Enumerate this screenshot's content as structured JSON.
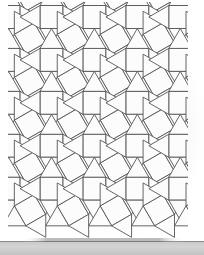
{
  "figure": {
    "shape_names": {
      "axis_square": "axis-aligned-square",
      "rotated_square": "rotated-square",
      "triangle": "equilateral-triangle"
    }
  },
  "colors": {
    "background": "#ffffff",
    "tile_fill": "#fcfcfc",
    "tile_stroke": "#555555",
    "ground_fill": "#cfcfcf",
    "ground_line": "#8a8a8a",
    "shadow": "#7a7a7a",
    "panel_edge": "#9a9a9a"
  },
  "geometry": {
    "canvas_width": 204,
    "canvas_height": 255,
    "edge_length": 23,
    "origin_x": 51.5,
    "origin_y": 17,
    "columns": 4,
    "rows": 4,
    "cell_width": 31.4,
    "cell_height": 31.4,
    "rotation_angle_deg": 30,
    "ground_y": 241,
    "ground_height": 14,
    "stroke_width": 0.9
  },
  "chart_data": {
    "type": "diagram",
    "vertex_configuration": "3.3.4.3.4",
    "tile_counts": {
      "squares": 40,
      "triangles": 64
    }
  },
  "labels": {
    "ground_label": "",
    "figure_caption": ""
  }
}
